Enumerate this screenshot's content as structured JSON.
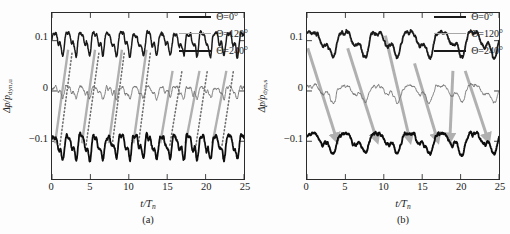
{
  "figure": {
    "panels": [
      {
        "id": "a",
        "subcaption": "(a)",
        "ylabel_main": "Δp/p",
        "ylabel_sub": "dyn,u",
        "xlabel_main": "t/T",
        "xlabel_sub": "n",
        "legend": [
          {
            "label": "Θ=0°",
            "color": "#1a1a1a",
            "width": 2.6
          },
          {
            "label": "Θ=120°",
            "color": "#a8a8a8",
            "width": 1.5
          },
          {
            "label": "Θ=240°",
            "color": "#1a1a1a",
            "width": 2.6
          }
        ]
      },
      {
        "id": "b",
        "subcaption": "(b)",
        "ylabel_main": "Δp/p",
        "ylabel_sub": "dyn,s",
        "xlabel_main": "t/T",
        "xlabel_sub": "n",
        "legend": [
          {
            "label": "Θ=0°",
            "color": "#1a1a1a",
            "width": 2.6
          },
          {
            "label": "Θ=120°",
            "color": "#a8a8a8",
            "width": 1.5
          },
          {
            "label": "Θ=240°",
            "color": "#1a1a1a",
            "width": 2.6
          }
        ]
      }
    ]
  },
  "chart_data": [
    {
      "type": "line",
      "panel": "a",
      "title": "",
      "xlabel": "t/T_n",
      "ylabel": "Δp/p_dyn,u",
      "xlim": [
        0,
        25
      ],
      "ylim": [
        -0.175,
        0.155
      ],
      "xticks": [
        0,
        5,
        10,
        15,
        20,
        25
      ],
      "yticks": [
        0.1,
        0,
        -0.1
      ],
      "ytick_labels": [
        "0.1",
        "0",
        "−0.1"
      ],
      "grid": false,
      "legend_position": "top-right",
      "annotations": {
        "solid_gray_lines": {
          "style": "solid",
          "color": "#b0b0b0",
          "width": 2.4,
          "description": "positive-slope lines tracking upstream pressure-trough propagation",
          "segments": [
            {
              "x0": 0.4,
              "y0": -0.104,
              "x1": 2.1,
              "y1": 0.082
            },
            {
              "x0": 3.9,
              "y0": -0.104,
              "x1": 5.6,
              "y1": 0.082
            },
            {
              "x0": 7.4,
              "y0": -0.104,
              "x1": 9.1,
              "y1": 0.082
            },
            {
              "x0": 10.6,
              "y0": -0.104,
              "x1": 12.3,
              "y1": 0.082
            },
            {
              "x0": 14.1,
              "y0": -0.104,
              "x1": 15.7,
              "y1": 0.04
            },
            {
              "x0": 17.4,
              "y0": -0.104,
              "x1": 19.2,
              "y1": 0.04
            },
            {
              "x0": 20.9,
              "y0": -0.104,
              "x1": 22.7,
              "y1": 0.04
            }
          ]
        },
        "dotted_gray_lines": {
          "style": "dotted",
          "color": "#6e6e6e",
          "width": 1.6,
          "description": "negative-slope dotted lines tracking downstream propagation",
          "segments": [
            {
              "x0": 2.6,
              "y0": 0.075,
              "x1": 1.0,
              "y1": -0.112
            },
            {
              "x0": 6.1,
              "y0": 0.075,
              "x1": 4.4,
              "y1": -0.112
            },
            {
              "x0": 9.4,
              "y0": 0.075,
              "x1": 7.8,
              "y1": -0.112
            },
            {
              "x0": 12.8,
              "y0": 0.075,
              "x1": 11.2,
              "y1": -0.112
            },
            {
              "x0": 16.9,
              "y0": 0.038,
              "x1": 15.3,
              "y1": -0.112
            },
            {
              "x0": 20.2,
              "y0": 0.038,
              "x1": 18.7,
              "y1": -0.112
            },
            {
              "x0": 23.6,
              "y0": 0.038,
              "x1": 22.1,
              "y1": -0.112
            }
          ]
        }
      },
      "series": [
        {
          "name": "Θ=0°",
          "color": "#1a1a1a",
          "width": 1.5,
          "baseline": 0.1,
          "amplitude": 0.028,
          "period": 1.75,
          "noise": 0.013,
          "seed": 11,
          "description": "upper trace oscillating about Δp/p = 0.1"
        },
        {
          "name": "Θ=120°",
          "color": "#6d6d6d",
          "width": 0.9,
          "baseline": 0.0,
          "amplitude": 0.014,
          "period": 1.75,
          "noise": 0.01,
          "seed": 27,
          "description": "middle trace oscillating about Δp/p = 0"
        },
        {
          "name": "Θ=240°",
          "color": "#0d0d0d",
          "width": 1.8,
          "baseline": -0.105,
          "amplitude": 0.03,
          "period": 1.75,
          "noise": 0.013,
          "seed": 43,
          "description": "lower trace oscillating about Δp/p = −0.1"
        }
      ]
    },
    {
      "type": "line",
      "panel": "b",
      "title": "",
      "xlabel": "t/T_n",
      "ylabel": "Δp/p_dyn,s",
      "xlim": [
        0,
        25
      ],
      "ylim": [
        -0.175,
        0.155
      ],
      "xticks": [
        0,
        5,
        10,
        15,
        20,
        25
      ],
      "yticks": [
        0.1,
        0,
        -0.1
      ],
      "ytick_labels": [
        "0.1",
        "0",
        "−0.1"
      ],
      "grid": false,
      "legend_position": "top-right",
      "annotations": {
        "gray_arrows": {
          "style": "arrow",
          "color": "#b0b0b0",
          "width": 3.0,
          "description": "thick negative-slope arrows from upper trace down to lower trace",
          "segments": [
            {
              "x0": 0.1,
              "y0": 0.085,
              "x1": 3.9,
              "y1": -0.098
            },
            {
              "x0": 5.3,
              "y0": 0.085,
              "x1": 9.1,
              "y1": -0.098
            },
            {
              "x0": 10.2,
              "y0": 0.11,
              "x1": 13.4,
              "y1": -0.098
            },
            {
              "x0": 14.0,
              "y0": 0.055,
              "x1": 17.0,
              "y1": -0.098
            },
            {
              "x0": 19.0,
              "y0": 0.04,
              "x1": 18.6,
              "y1": -0.098
            },
            {
              "x0": 20.6,
              "y0": 0.04,
              "x1": 23.6,
              "y1": -0.098
            }
          ]
        }
      },
      "series": [
        {
          "name": "Θ=0°",
          "color": "#1a1a1a",
          "width": 1.8,
          "baseline": 0.1,
          "amplitude": 0.032,
          "period": 4.2,
          "noise": 0.01,
          "seed": 7,
          "description": "upper trace, slow large-scale oscillation about 0.1"
        },
        {
          "name": "Θ=120°",
          "color": "#6d6d6d",
          "width": 0.9,
          "baseline": 0.0,
          "amplitude": 0.021,
          "period": 4.2,
          "noise": 0.008,
          "seed": 19,
          "description": "middle trace, slow oscillation about 0"
        },
        {
          "name": "Θ=240°",
          "color": "#0d0d0d",
          "width": 1.9,
          "baseline": -0.098,
          "amplitude": 0.026,
          "period": 4.2,
          "noise": 0.01,
          "seed": 31,
          "description": "lower trace, slow oscillation about −0.1"
        }
      ]
    }
  ]
}
